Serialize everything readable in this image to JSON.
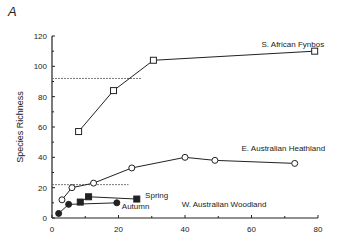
{
  "panel_label": "A",
  "chart_data": {
    "type": "line",
    "title": "",
    "xlabel": "",
    "ylabel": "Species Richness",
    "xlim": [
      0,
      80
    ],
    "ylim": [
      0,
      120
    ],
    "x_ticks": [
      0,
      20,
      40,
      60,
      80
    ],
    "x_minor_ticks": [
      10,
      30,
      50,
      70
    ],
    "y_ticks": [
      0,
      20,
      40,
      60,
      80,
      100,
      120
    ],
    "y_minor_ticks": [
      10,
      30,
      50,
      70,
      90,
      110
    ],
    "grid": false,
    "series": [
      {
        "name": "S. African Fynbos",
        "marker": "open-square",
        "x": [
          8,
          18.5,
          30.5,
          79
        ],
        "y": [
          57,
          84,
          104,
          110
        ],
        "label_pos": [
          63,
          113
        ]
      },
      {
        "name": "E. Australian Heathland",
        "marker": "open-circle",
        "x": [
          3,
          6,
          12.5,
          24,
          40,
          49,
          73
        ],
        "y": [
          12,
          20,
          23,
          33,
          40,
          38,
          36
        ],
        "label_pos": [
          57,
          44
        ]
      },
      {
        "name": "Spring",
        "marker": "filled-square",
        "x": [
          8.5,
          11,
          25.5
        ],
        "y": [
          10.5,
          14,
          12.5
        ],
        "label_pos": [
          28,
          13
        ]
      },
      {
        "name": "Autumn",
        "marker": "filled-circle",
        "x": [
          2,
          5,
          19.5
        ],
        "y": [
          3,
          9,
          10
        ],
        "label_pos": [
          21,
          6
        ]
      }
    ],
    "annotations": [
      {
        "text": "W. Australian Woodland",
        "x": 39,
        "y": 7
      },
      {
        "type": "dashed-hline",
        "y": 92,
        "x_from": 0,
        "x_to": 27
      },
      {
        "type": "dashed-hline",
        "y": 22,
        "x_from": 0,
        "x_to": 23
      }
    ]
  }
}
